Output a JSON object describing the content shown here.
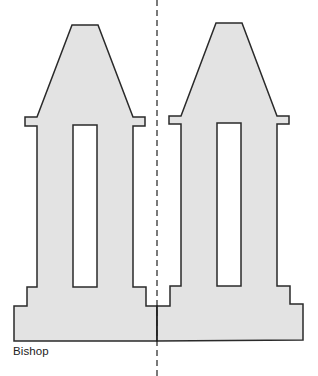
{
  "diagram": {
    "caption": "Bishop",
    "shapes": [
      {
        "name": "left-bishop-piece",
        "fill": "#e3e3e3",
        "stroke": "#2a2a2a"
      },
      {
        "name": "right-bishop-piece",
        "fill": "#e3e3e3",
        "stroke": "#2a2a2a"
      }
    ],
    "symmetry_axis": {
      "style": "dashed",
      "color": "#222222"
    }
  }
}
